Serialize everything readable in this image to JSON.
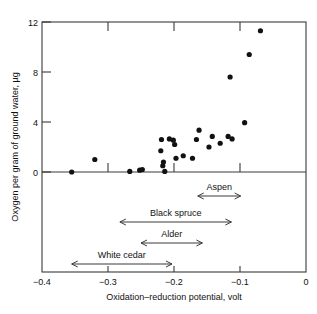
{
  "chart_data": {
    "type": "scatter",
    "title": "",
    "subtitle": "",
    "xlabel": "Oxidation–reduction potential, volt",
    "ylabel": "Oxygen per gram of ground water, µg",
    "xlim": [
      -0.4,
      0.0
    ],
    "ylim": [
      0,
      12
    ],
    "xticks": [
      -0.4,
      -0.3,
      -0.2,
      -0.1,
      0
    ],
    "xtick_labels": [
      "−0.4",
      "−0.3",
      "−0.2",
      "−0.1",
      "0"
    ],
    "yticks": [
      0,
      4,
      8,
      12
    ],
    "ytick_labels": [
      "0",
      "4",
      "8",
      "12"
    ],
    "grid": false,
    "legend": "none",
    "marker": "filled-circle",
    "marker_color": "#111111",
    "axis_color": "#333333",
    "background": "#ffffff",
    "points": [
      {
        "x": -0.355,
        "y": 0.0
      },
      {
        "x": -0.32,
        "y": 1.0
      },
      {
        "x": -0.267,
        "y": 0.05
      },
      {
        "x": -0.252,
        "y": 0.15
      },
      {
        "x": -0.248,
        "y": 0.2
      },
      {
        "x": -0.22,
        "y": 1.7
      },
      {
        "x": -0.217,
        "y": 0.5
      },
      {
        "x": -0.216,
        "y": 0.8
      },
      {
        "x": -0.214,
        "y": 0.05
      },
      {
        "x": -0.219,
        "y": 2.6
      },
      {
        "x": -0.207,
        "y": 2.65
      },
      {
        "x": -0.201,
        "y": 2.55
      },
      {
        "x": -0.199,
        "y": 2.2
      },
      {
        "x": -0.197,
        "y": 1.1
      },
      {
        "x": -0.186,
        "y": 1.3
      },
      {
        "x": -0.172,
        "y": 1.1
      },
      {
        "x": -0.166,
        "y": 2.6
      },
      {
        "x": -0.162,
        "y": 3.35
      },
      {
        "x": -0.147,
        "y": 2.0
      },
      {
        "x": -0.142,
        "y": 2.85
      },
      {
        "x": -0.13,
        "y": 2.3
      },
      {
        "x": -0.118,
        "y": 2.85
      },
      {
        "x": -0.115,
        "y": 7.6
      },
      {
        "x": -0.112,
        "y": 2.65
      },
      {
        "x": -0.093,
        "y": 3.95
      },
      {
        "x": -0.086,
        "y": 9.4
      },
      {
        "x": -0.069,
        "y": 11.3
      }
    ],
    "annotations": [
      {
        "label": "Aspen",
        "x_start": -0.164,
        "x_end": -0.099,
        "row": 0
      },
      {
        "label": "Black spruce",
        "x_start": -0.282,
        "x_end": -0.113,
        "row": 1
      },
      {
        "label": "Alder",
        "x_start": -0.25,
        "x_end": -0.157,
        "row": 2
      },
      {
        "label": "White cedar",
        "x_start": -0.355,
        "x_end": -0.203,
        "row": 3
      }
    ]
  }
}
